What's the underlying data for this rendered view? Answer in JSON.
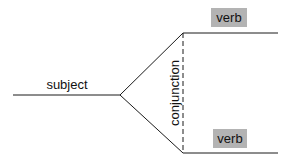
{
  "diagram": {
    "type": "sentence-diagram",
    "subject": {
      "label": "subject"
    },
    "conjunction": {
      "label": "conjunction"
    },
    "predicates": [
      {
        "label": "verb",
        "position": "top"
      },
      {
        "label": "verb",
        "position": "bottom"
      }
    ],
    "colors": {
      "line": "#1a1a1a",
      "verb_box": "#b3b3b3",
      "background": "#ffffff"
    }
  }
}
